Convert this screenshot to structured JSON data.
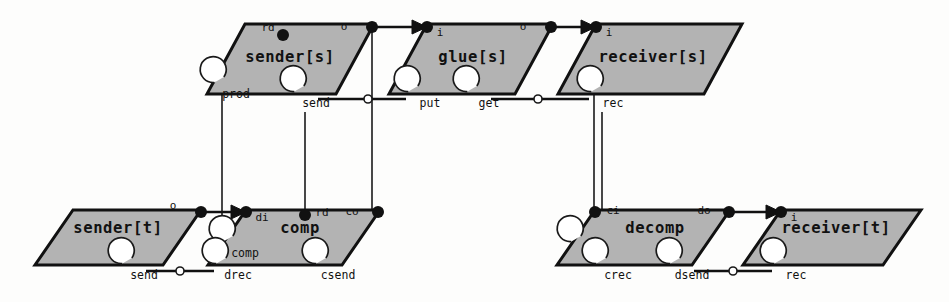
{
  "diagram": {
    "type": "component-port-connector-diagram",
    "background_color": "#fdfdfc",
    "component_fill_color": "#b3b3b3",
    "component_stroke_color": "#111111",
    "components": [
      {
        "id": "sender_s",
        "label": "sender[s]",
        "label_x": 290,
        "label_y": 57,
        "shape": "parallelogram",
        "top_y": 24,
        "bottom_y": 94,
        "top_left_x": 245,
        "top_right_x": 374,
        "bottom_left_x": 207,
        "bottom_right_x": 336
      },
      {
        "id": "glue_s",
        "label": "glue[s]",
        "label_x": 473,
        "label_y": 57,
        "shape": "parallelogram",
        "top_y": 24,
        "bottom_y": 94,
        "top_left_x": 427,
        "top_right_x": 553,
        "bottom_left_x": 389,
        "bottom_right_x": 515
      },
      {
        "id": "receiver_s",
        "label": "receiver[s]",
        "label_x": 653,
        "label_y": 57,
        "shape": "parallelogram",
        "top_y": 24,
        "bottom_y": 94,
        "top_left_x": 596,
        "top_right_x": 742,
        "bottom_left_x": 558,
        "bottom_right_x": 704
      },
      {
        "id": "sender_t",
        "label": "sender[t]",
        "label_x": 118,
        "label_y": 228,
        "shape": "parallelogram",
        "top_y": 210,
        "bottom_y": 265,
        "top_left_x": 73,
        "top_right_x": 201,
        "bottom_left_x": 35,
        "bottom_right_x": 163
      },
      {
        "id": "comp",
        "label": "comp",
        "label_x": 300,
        "label_y": 228,
        "shape": "parallelogram",
        "top_y": 210,
        "bottom_y": 265,
        "top_left_x": 246,
        "top_right_x": 380,
        "bottom_left_x": 208,
        "bottom_right_x": 342
      },
      {
        "id": "decomp",
        "label": "decomp",
        "label_x": 655,
        "label_y": 228,
        "shape": "parallelogram",
        "top_y": 210,
        "bottom_y": 265,
        "top_left_x": 595,
        "top_right_x": 730,
        "bottom_left_x": 557,
        "bottom_right_x": 692
      },
      {
        "id": "receiver_t",
        "label": "receiver[t]",
        "label_x": 836,
        "label_y": 228,
        "shape": "parallelogram",
        "top_y": 210,
        "bottom_y": 265,
        "top_left_x": 781,
        "top_right_x": 921,
        "bottom_left_x": 743,
        "bottom_right_x": 883
      }
    ],
    "ports": [
      {
        "id": "sender_s_rd",
        "label": "rd",
        "dot_x": 283,
        "dot_y": 35,
        "label_x": 268,
        "label_y": 28,
        "filled": true
      },
      {
        "id": "sender_s_o",
        "label": "o",
        "dot_x": 372,
        "dot_y": 27,
        "label_x": 344,
        "label_y": 27,
        "filled": true
      },
      {
        "id": "glue_s_i",
        "label": "i",
        "dot_x": 427,
        "dot_y": 27,
        "label_x": 440,
        "label_y": 33,
        "filled": true
      },
      {
        "id": "glue_s_o",
        "label": "o",
        "dot_x": 551,
        "dot_y": 27,
        "label_x": 523,
        "label_y": 27,
        "filled": true
      },
      {
        "id": "receiver_s_i",
        "label": "i",
        "dot_x": 596,
        "dot_y": 27,
        "label_x": 609,
        "label_y": 33,
        "filled": true
      },
      {
        "id": "sender_t_o",
        "label": "o",
        "dot_x": 201,
        "dot_y": 212,
        "label_x": 173,
        "label_y": 206,
        "filled": true
      },
      {
        "id": "comp_di",
        "label": "di",
        "dot_x": 246,
        "dot_y": 212,
        "label_x": 262,
        "label_y": 218,
        "filled": true
      },
      {
        "id": "comp_rd",
        "label": "rd",
        "dot_x": 305,
        "dot_y": 215,
        "label_x": 322,
        "label_y": 213,
        "filled": true
      },
      {
        "id": "comp_co",
        "label": "co",
        "dot_x": 378,
        "dot_y": 212,
        "label_x": 352,
        "label_y": 212,
        "filled": true
      },
      {
        "id": "decomp_ci",
        "label": "ci",
        "dot_x": 595,
        "dot_y": 212,
        "label_x": 613,
        "label_y": 211,
        "filled": true
      },
      {
        "id": "decomp_do",
        "label": "do",
        "dot_x": 729,
        "dot_y": 212,
        "label_x": 704,
        "label_y": 211,
        "filled": true
      },
      {
        "id": "receiver_t_i",
        "label": "i",
        "dot_x": 781,
        "dot_y": 212,
        "label_x": 794,
        "label_y": 218,
        "filled": true
      }
    ],
    "interfaces": [
      {
        "id": "prod",
        "label": "prod",
        "cx": 225,
        "cy": 90,
        "r": 13
      },
      {
        "id": "send_s",
        "label": "send",
        "cx": 305,
        "cy": 99,
        "r": 13
      },
      {
        "id": "put",
        "label": "put",
        "cx": 419,
        "cy": 99,
        "r": 13
      },
      {
        "id": "get",
        "label": "get",
        "cx": 478,
        "cy": 99,
        "r": 13
      },
      {
        "id": "rec_s",
        "label": "rec",
        "cx": 602,
        "cy": 99,
        "r": 13
      },
      {
        "id": "send_t",
        "label": "send",
        "cx": 133,
        "cy": 271,
        "r": 13
      },
      {
        "id": "comp_i",
        "label": "comp",
        "cx": 234,
        "cy": 249,
        "r": 13
      },
      {
        "id": "drec",
        "label": "drec",
        "cx": 227,
        "cy": 271,
        "r": 13
      },
      {
        "id": "csend",
        "label": "csend",
        "cx": 327,
        "cy": 271,
        "r": 13
      },
      {
        "id": "dec",
        "label": "dec",
        "cx": 582,
        "cy": 249,
        "r": 13
      },
      {
        "id": "crec",
        "label": "crec",
        "cx": 607,
        "cy": 271,
        "r": 13
      },
      {
        "id": "dsend",
        "label": "dsend",
        "cx": 681,
        "cy": 271,
        "r": 13
      },
      {
        "id": "rec_t",
        "label": "rec",
        "cx": 785,
        "cy": 271,
        "r": 13
      }
    ],
    "connectors": [
      {
        "id": "send-put-link",
        "from": "send_s",
        "to": "put",
        "x1": 318,
        "y1": 99,
        "x2": 406,
        "y2": 99,
        "mid_x": 368,
        "mid_y": 99
      },
      {
        "id": "get-rec-link",
        "from": "get",
        "to": "rec_s",
        "x1": 491,
        "y1": 99,
        "x2": 589,
        "y2": 99,
        "mid_x": 538,
        "mid_y": 99
      },
      {
        "id": "sendt-drec-link",
        "from": "send_t",
        "to": "drec",
        "x1": 146,
        "y1": 271,
        "x2": 214,
        "y2": 271,
        "mid_x": 180,
        "mid_y": 271
      },
      {
        "id": "dsend-rect-link",
        "from": "dsend",
        "to": "rec_t",
        "x1": 694,
        "y1": 271,
        "x2": 772,
        "y2": 271,
        "mid_x": 733,
        "mid_y": 271
      }
    ],
    "arrows": [
      {
        "id": "sender_s-to-glue_s",
        "x1": 372,
        "y1": 27,
        "x2": 427,
        "y2": 27
      },
      {
        "id": "glue_s-to-receiver_s",
        "x1": 551,
        "y1": 27,
        "x2": 596,
        "y2": 27
      },
      {
        "id": "sender_t-to-comp",
        "x1": 201,
        "y1": 212,
        "x2": 246,
        "y2": 212
      },
      {
        "id": "decomp-to-receiver_t",
        "x1": 729,
        "y1": 212,
        "x2": 781,
        "y2": 212
      }
    ],
    "vertical_links": [
      {
        "id": "prod-to-drec",
        "x": 222,
        "y1": 94,
        "y2": 259
      },
      {
        "id": "send_s-to-comp_rd",
        "x": 305,
        "y1": 112,
        "y2": 215
      },
      {
        "id": "sender_s_o-to-co",
        "x": 372,
        "y1": 27,
        "y2": 212
      },
      {
        "id": "receiver_s_i-to-ci",
        "x": 594,
        "y1": 27,
        "y2": 212
      },
      {
        "id": "rec_s-to-crec",
        "x": 602,
        "y1": 112,
        "y2": 259
      }
    ]
  }
}
